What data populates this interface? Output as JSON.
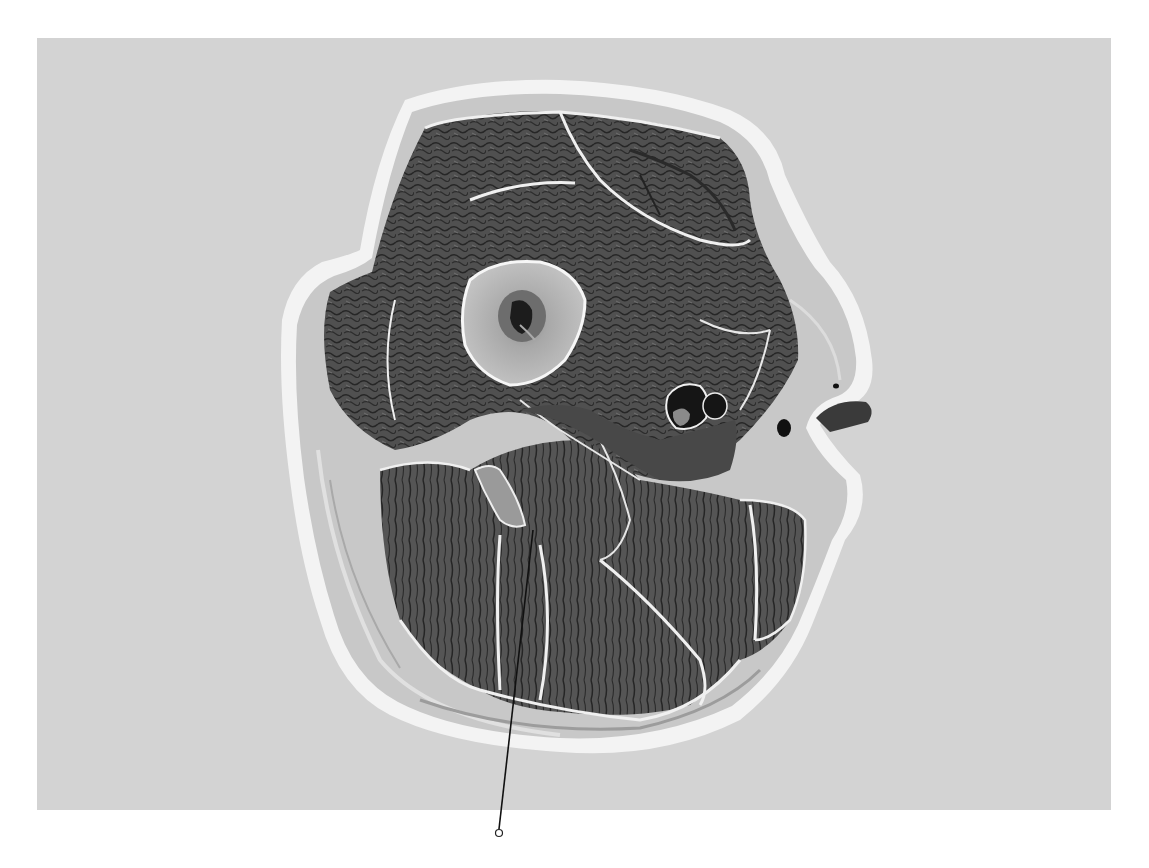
{
  "image": {
    "subject": "Transverse anatomical cross-section of a thigh",
    "width": 1149,
    "height": 868,
    "background_color": "#ffffff",
    "photo_area": {
      "x": 37,
      "y": 38,
      "width": 1074,
      "height": 772,
      "color": "#d3d3d3"
    }
  },
  "colors": {
    "skin_rim": "#f4f4f4",
    "subcutaneous": "#c9c9c9",
    "muscle": "#4e4e4e",
    "muscle_dark": "#2e2e2e",
    "fascia": "#f2f2f2",
    "bone_cortex": "#bdbdbd",
    "marrow": "#7a7a7a",
    "vessel": "#161616",
    "leader_line": "#111111"
  },
  "leader": {
    "label": "",
    "start": {
      "x": 533,
      "y": 530
    },
    "end": {
      "x": 499,
      "y": 833
    },
    "end_marker": "open-circle"
  },
  "structures": [
    {
      "name": "femur",
      "center": {
        "x": 515,
        "y": 308
      }
    },
    {
      "name": "marrow-cavity",
      "center": {
        "x": 522,
        "y": 318
      }
    },
    {
      "name": "femoral-vessels",
      "center": {
        "x": 690,
        "y": 405
      }
    },
    {
      "name": "great-saphenous-vein",
      "center": {
        "x": 784,
        "y": 425
      }
    },
    {
      "name": "sciatic-nerve-region",
      "center": {
        "x": 492,
        "y": 485
      }
    }
  ]
}
